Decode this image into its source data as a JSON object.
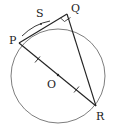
{
  "diagram": {
    "type": "geometry-circle",
    "colors": {
      "circle": "#6e6e6e",
      "line": "#222222",
      "text": "#222222",
      "background": "#ffffff"
    },
    "circle": {
      "center_label": "O",
      "cx": 58,
      "cy": 76,
      "r": 47
    },
    "points": {
      "P": {
        "label": "P",
        "x": 19,
        "y": 43
      },
      "Q": {
        "label": "Q",
        "x": 67,
        "y": 14
      },
      "R": {
        "label": "R",
        "x": 96,
        "y": 106
      },
      "O": {
        "label": "O",
        "x": 58,
        "y": 75
      },
      "S": {
        "label": "S"
      }
    },
    "labels": {
      "P": "P",
      "Q": "Q",
      "R": "R",
      "O": "O",
      "S": "S"
    },
    "segments": [
      "PQ",
      "QR",
      "PR"
    ],
    "annotations": {
      "right_angle_at": "Q",
      "equal_ticks": [
        "PO",
        "OR"
      ],
      "arc": "PS"
    }
  }
}
